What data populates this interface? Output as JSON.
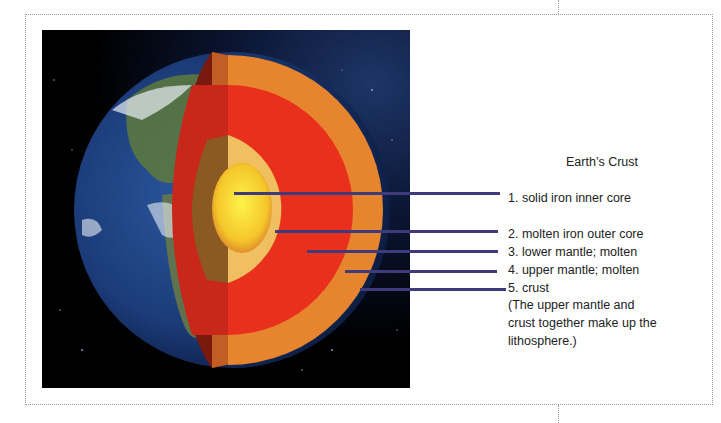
{
  "diagram": {
    "title": "Earth’s Crust",
    "image_subject": "Cutaway illustration of Earth showing internal layers",
    "layers": [
      {
        "id": 1,
        "label": "1. solid iron inner core",
        "color": "#f3d23a"
      },
      {
        "id": 2,
        "label": "2. molten iron outer core",
        "color": "#f0c060"
      },
      {
        "id": 3,
        "label": "3. lower mantle; molten",
        "color": "#e8301c"
      },
      {
        "id": 4,
        "label": "4. upper mantle; molten",
        "color": "#e0822c"
      },
      {
        "id": 5,
        "label": "5. crust",
        "color": "#b85a1e"
      }
    ],
    "note_lines": [
      "(The upper mantle and",
      "crust together make up the",
      "lithosphere.)"
    ],
    "leader_color": "#3f3a7a"
  }
}
